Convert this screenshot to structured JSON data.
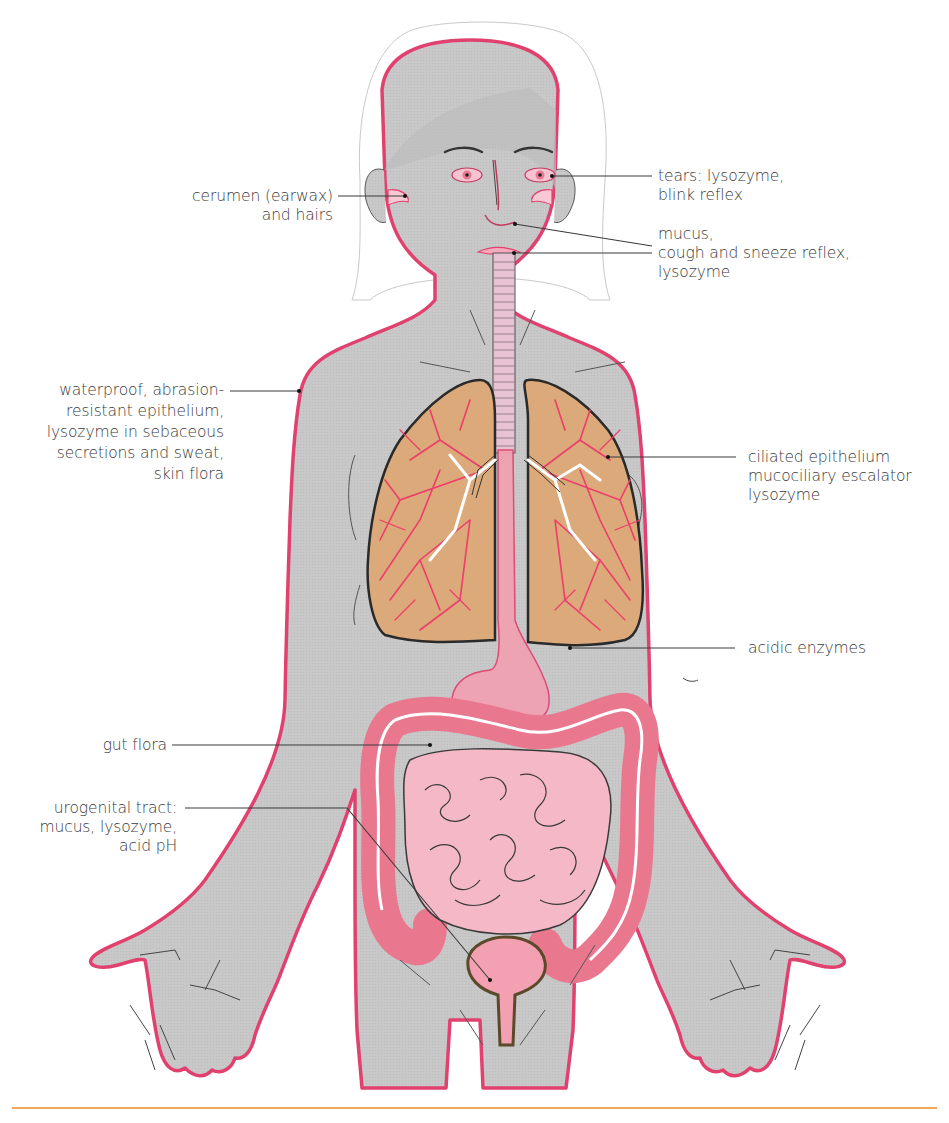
{
  "figure": {
    "colors": {
      "body_fill": "#c9c9c9",
      "body_outline": "#e0416e",
      "lung_fill": "#dba97a",
      "bronchiole": "#ee3d6a",
      "organ_pink": "#f2a0b2",
      "colon": "#e9788f",
      "small_intestine": "#f4b8c6",
      "leader_line": "#3a3a3a",
      "rule": "#f0a85a",
      "text": "#3a3a3a"
    }
  },
  "labels": {
    "ear": {
      "lines": [
        "cerumen (earwax)",
        "and hairs"
      ],
      "side": "left"
    },
    "eyes": {
      "lines": [
        "tears: lysozyme,",
        "blink reflex"
      ],
      "side": "right"
    },
    "nose_mouth": {
      "lines": [
        "mucus,",
        "cough and sneeze reflex,",
        "lysozyme"
      ],
      "side": "right"
    },
    "skin": {
      "lines": [
        "waterproof, abrasion-",
        "resistant epithelium,",
        "lysozyme in sebaceous",
        "secretions and sweat,",
        "skin flora"
      ],
      "side": "left"
    },
    "lungs": {
      "lines": [
        "ciliated epithelium",
        "mucociliary escalator",
        "lysozyme"
      ],
      "side": "right"
    },
    "stomach": {
      "lines": [
        "acidic enzymes"
      ],
      "side": "right"
    },
    "gut": {
      "lines": [
        "gut flora"
      ],
      "side": "left"
    },
    "urogenital": {
      "lines": [
        "urogenital tract:",
        "mucus, lysozyme,",
        "acid pH"
      ],
      "side": "left"
    }
  }
}
